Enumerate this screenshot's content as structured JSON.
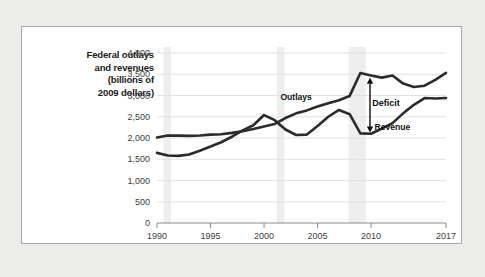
{
  "figure": {
    "background_color": "#ffffff",
    "page_background_color": "#ececeb",
    "border_color": "#a8a8a8"
  },
  "axis_title": {
    "line1": "Federal outlays",
    "line2": "and revenues",
    "line3": "(billions of",
    "line4": "2009 dollars)"
  },
  "annotations": {
    "outlays_label": "Outlays",
    "revenue_label": "Revenue",
    "deficit_label": "Deficit"
  },
  "chart_data": {
    "type": "line",
    "title": "Federal outlays and revenues (billions of 2009 dollars)",
    "xlabel": "",
    "ylabel": "Federal outlays and revenues (billions of 2009 dollars)",
    "xlim": [
      1990,
      2017
    ],
    "ylim": [
      0,
      4000
    ],
    "grid": true,
    "legend_position": "inline-annotations",
    "xticks": [
      1990,
      1995,
      2000,
      2005,
      2010,
      2017
    ],
    "xtick_labels": [
      "1990",
      "1995",
      "2000",
      "2005",
      "2010",
      "2017"
    ],
    "yticks": [
      0,
      500,
      1000,
      1500,
      2000,
      2500,
      3000,
      3500,
      4000
    ],
    "ytick_labels": [
      "0",
      "500",
      "1,000",
      "1,500",
      "2,000",
      "2,500",
      "3,000",
      "3,500",
      "4,000"
    ],
    "line_color": "#2b2b2b",
    "gridline_color": "#e2e2e2",
    "recession_band_color": "#eeeeee",
    "recession_bands": [
      {
        "start": 1990.6,
        "end": 1991.3
      },
      {
        "start": 2001.2,
        "end": 2001.9
      },
      {
        "start": 2007.9,
        "end": 2009.5
      }
    ],
    "x": [
      1990,
      1991,
      1992,
      1993,
      1994,
      1995,
      1996,
      1997,
      1998,
      1999,
      2000,
      2001,
      2002,
      2003,
      2004,
      2005,
      2006,
      2007,
      2008,
      2009,
      2010,
      2011,
      2012,
      2013,
      2014,
      2015,
      2016,
      2017
    ],
    "series": [
      {
        "name": "Outlays",
        "values": [
          2010,
          2060,
          2055,
          2050,
          2060,
          2080,
          2090,
          2120,
          2160,
          2210,
          2270,
          2330,
          2470,
          2580,
          2650,
          2740,
          2820,
          2890,
          2990,
          3530,
          3470,
          3420,
          3470,
          3280,
          3200,
          3230,
          3370,
          3530
        ]
      },
      {
        "name": "Revenue",
        "values": [
          1650,
          1590,
          1580,
          1610,
          1700,
          1800,
          1900,
          2030,
          2180,
          2300,
          2540,
          2420,
          2200,
          2070,
          2080,
          2280,
          2500,
          2660,
          2560,
          2110,
          2100,
          2220,
          2350,
          2580,
          2780,
          2940,
          2930,
          2940
        ]
      }
    ],
    "annotations": [
      {
        "text": "Outlays",
        "x": 2003.0,
        "y": 2890,
        "type": "series-label"
      },
      {
        "text": "Revenue",
        "x": 2012.0,
        "y": 2180,
        "type": "series-label"
      },
      {
        "text": "Deficit",
        "x": 2010.1,
        "y": 2750,
        "type": "gap-label"
      },
      {
        "text": "deficit-arrow",
        "x": 2009.9,
        "y_top": 3420,
        "y_bottom": 2130,
        "type": "double-arrow"
      }
    ]
  }
}
